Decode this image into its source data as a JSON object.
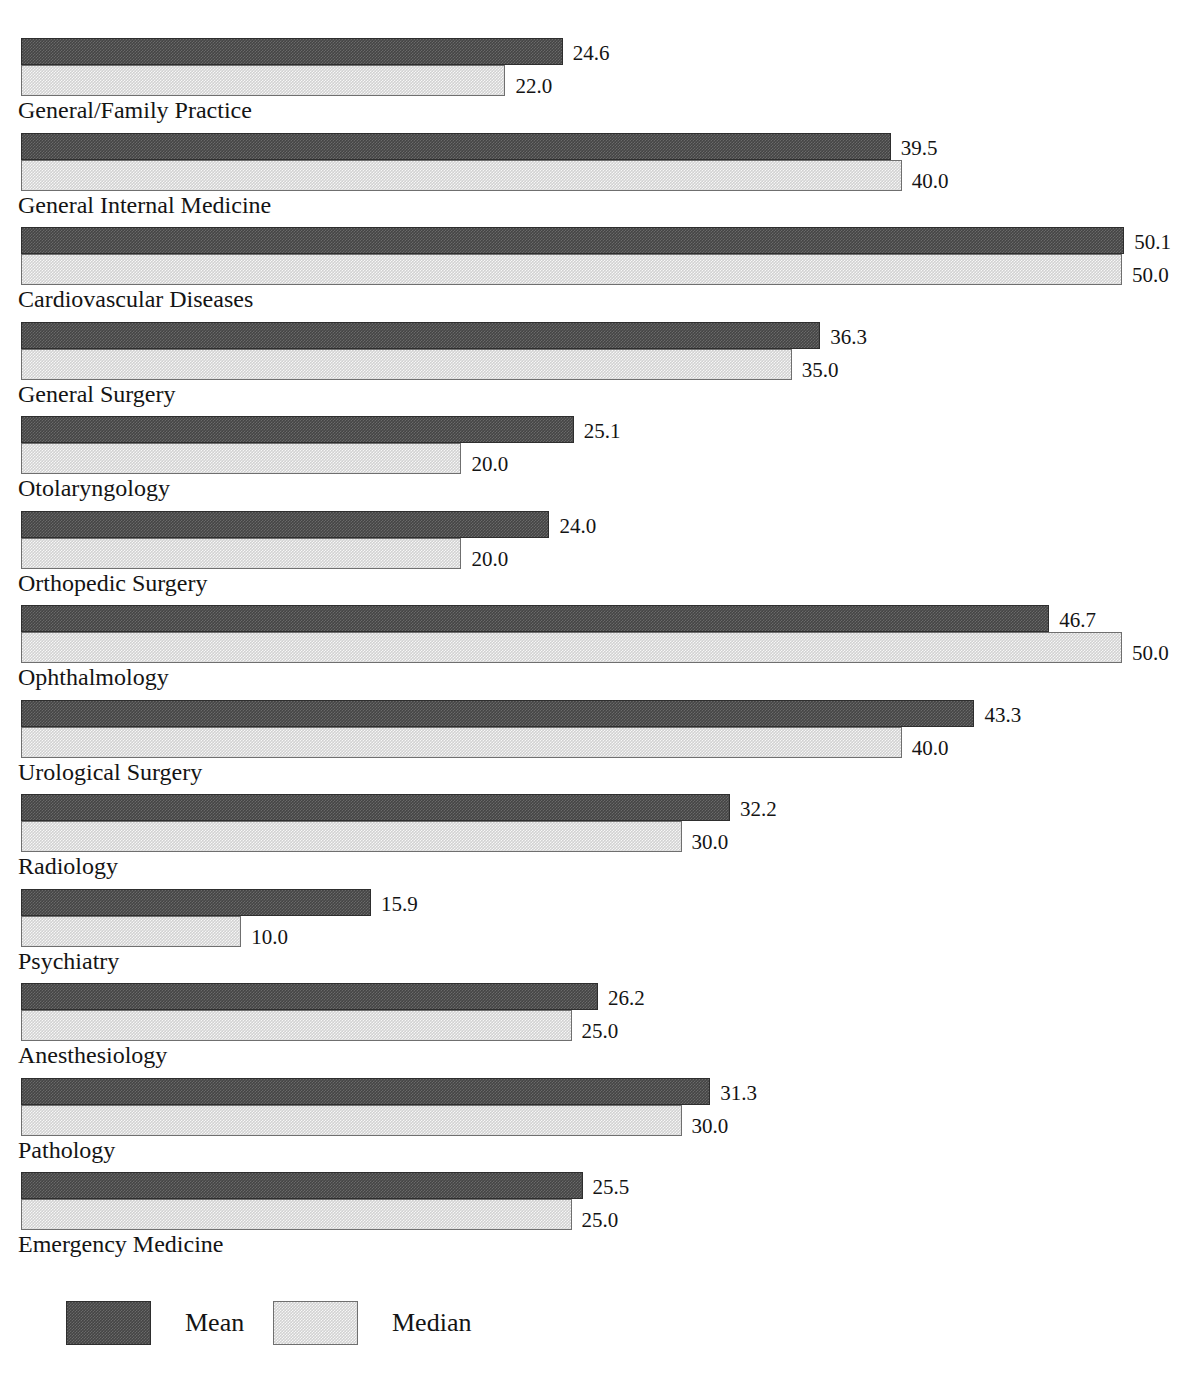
{
  "chart_data": {
    "type": "bar",
    "orientation": "horizontal",
    "title": "",
    "subtitle": "",
    "xlabel": "",
    "ylabel": "",
    "grid": false,
    "legend_position": "bottom-left",
    "value_label_format": "one-decimal",
    "xlim": [
      0,
      54
    ],
    "categories": [
      "General/Family Practice",
      "General Internal Medicine",
      "Cardiovascular Diseases",
      "General Surgery",
      "Otolaryngology",
      "Orthopedic Surgery",
      "Ophthalmology",
      "Urological Surgery",
      "Radiology",
      "Psychiatry",
      "Anesthesiology",
      "Pathology",
      "Emergency Medicine"
    ],
    "series": [
      {
        "name": "Mean",
        "color": "#454545",
        "values": [
          24.6,
          39.5,
          50.1,
          36.3,
          25.1,
          24.0,
          46.7,
          43.3,
          32.2,
          15.9,
          26.2,
          31.3,
          25.5
        ],
        "labels": [
          "24.6",
          "39.5",
          "50.1",
          "36.3",
          "25.1",
          "24.0",
          "46.7",
          "43.3",
          "32.2",
          "15.9",
          "26.2",
          "31.3",
          "25.5"
        ]
      },
      {
        "name": "Median",
        "color": "#d2d2d2",
        "values": [
          22.0,
          40.0,
          50.0,
          35.0,
          20.0,
          20.0,
          50.0,
          40.0,
          30.0,
          10.0,
          25.0,
          30.0,
          25.0
        ],
        "labels": [
          "22.0",
          "40.0",
          "50.0",
          "35.0",
          "20.0",
          "20.0",
          "50.0",
          "40.0",
          "30.0",
          "10.0",
          "25.0",
          "30.0",
          "25.0"
        ]
      }
    ]
  },
  "rows": [
    {
      "category": "General/Family Practice",
      "mean": 24.6,
      "median": 22.0,
      "mean_label": "24.6",
      "median_label": "22.0"
    },
    {
      "category": "General Internal Medicine",
      "mean": 39.5,
      "median": 40.0,
      "mean_label": "39.5",
      "median_label": "40.0"
    },
    {
      "category": "Cardiovascular Diseases",
      "mean": 50.1,
      "median": 50.0,
      "mean_label": "50.1",
      "median_label": "50.0"
    },
    {
      "category": "General Surgery",
      "mean": 36.3,
      "median": 35.0,
      "mean_label": "36.3",
      "median_label": "35.0"
    },
    {
      "category": "Otolaryngology",
      "mean": 25.1,
      "median": 20.0,
      "mean_label": "25.1",
      "median_label": "20.0"
    },
    {
      "category": "Orthopedic Surgery",
      "mean": 24.0,
      "median": 20.0,
      "mean_label": "24.0",
      "median_label": "20.0"
    },
    {
      "category": "Ophthalmology",
      "mean": 46.7,
      "median": 50.0,
      "mean_label": "46.7",
      "median_label": "50.0"
    },
    {
      "category": "Urological Surgery",
      "mean": 43.3,
      "median": 40.0,
      "mean_label": "43.3",
      "median_label": "40.0"
    },
    {
      "category": "Radiology",
      "mean": 32.2,
      "median": 30.0,
      "mean_label": "32.2",
      "median_label": "30.0"
    },
    {
      "category": "Psychiatry",
      "mean": 15.9,
      "median": 10.0,
      "mean_label": "15.9",
      "median_label": "10.0"
    },
    {
      "category": "Anesthesiology",
      "mean": 26.2,
      "median": 25.0,
      "mean_label": "26.2",
      "median_label": "25.0"
    },
    {
      "category": "Pathology",
      "mean": 31.3,
      "median": 30.0,
      "mean_label": "31.3",
      "median_label": "30.0"
    },
    {
      "category": "Emergency Medicine",
      "mean": 25.5,
      "median": 25.0,
      "mean_label": "25.5",
      "median_label": "25.0"
    }
  ],
  "legend": {
    "entries": [
      {
        "label": "Mean",
        "color": "#454545",
        "swatch": "mean-swatch"
      },
      {
        "label": "Median",
        "color": "#d2d2d2",
        "swatch": "median-swatch"
      }
    ]
  },
  "layout": {
    "bar_origin_x": 21,
    "pixels_per_unit": 22.02,
    "group_top": 38,
    "group_pitch": 94.5,
    "label_gap": 10,
    "legend_mean_x": 66,
    "legend_median_x": 273
  }
}
